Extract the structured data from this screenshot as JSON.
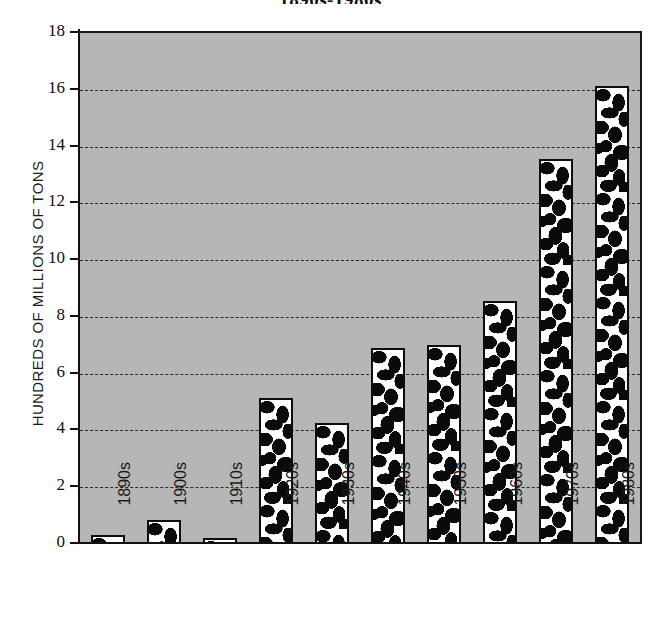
{
  "chart_data": {
    "type": "bar",
    "title": "1890s-1980s",
    "xlabel": "",
    "ylabel": "HUNDREDS OF MILLIONS OF TONS",
    "categories": [
      "1890s",
      "1900s",
      "1910s",
      "1920s",
      "1930s",
      "1940s",
      "1950s",
      "1960s",
      "1970s",
      "1980s"
    ],
    "values": [
      0.3,
      0.85,
      0.2,
      5.15,
      4.25,
      6.9,
      7.0,
      8.55,
      13.55,
      16.15
    ],
    "ylim": [
      0,
      18
    ],
    "yticks": [
      0,
      2,
      4,
      6,
      8,
      10,
      12,
      14,
      16,
      18
    ],
    "ytick_labels": [
      "0",
      "2",
      "4",
      "6",
      "8",
      "10",
      "12",
      "14",
      "16",
      "18"
    ],
    "grid": true,
    "grid_style": "dashed-horizontal",
    "legend": "none",
    "bar_fill": "black-and-white-mottled-pattern",
    "plot_background_color": "#b6b6b6",
    "axis_color": "#111111",
    "bar_border_color": "#0d0d0d",
    "figure_background_color": "#ffffff"
  }
}
